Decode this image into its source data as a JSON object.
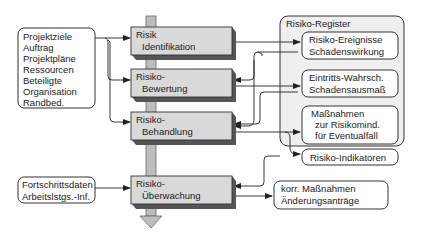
{
  "colors": {
    "stroke": "#333333",
    "process_fill": "#d9d9d9",
    "process_shadow": "#555555",
    "register_fill": "#efefef",
    "spine_fill": "#bdbdbd"
  },
  "inputs": {
    "project": [
      "Projektziele",
      "Auftrag",
      "Projektpläne",
      "Ressourcen",
      "Beteiligte",
      "Organisation",
      "Randbed."
    ],
    "progress": [
      "Fortschrittsdaten",
      "Arbeitslstgs.-Inf."
    ]
  },
  "process": [
    {
      "line1": "Risik",
      "line2": "Identifikation"
    },
    {
      "line1": "Risiko-",
      "line2": "Bewertung"
    },
    {
      "line1": "Risiko-",
      "line2": "Behandlung"
    },
    {
      "line1": "Risiko-",
      "line2": "Überwachung"
    }
  ],
  "register": {
    "title": "Risiko-Register",
    "items": [
      [
        "Risiko-Ereignisse",
        "Schadenswirkung"
      ],
      [
        "Eintritts-Wahrsch.",
        "Schadensausmaß"
      ],
      [
        "Maßnahmen",
        "zur Risikomind.",
        "für Eventualfall"
      ],
      [
        "Risiko-Indikatoren"
      ]
    ]
  },
  "output": [
    "korr. Maßnahmen",
    "Änderungsanträge"
  ]
}
